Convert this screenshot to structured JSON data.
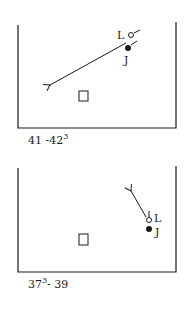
{
  "panels": [
    {
      "caption": "41 -42",
      "caption_sup": "3",
      "markers": {
        "open_label": "L",
        "filled_label": "J"
      },
      "arrow_direction": "down-left"
    },
    {
      "caption_pre": "37",
      "caption_sup": "3",
      "caption_post": "- 39",
      "markers": {
        "open_label": "L",
        "filled_label": "J"
      },
      "arrow_direction": "up-left"
    }
  ],
  "colors": {
    "ink": "#1a1a1a",
    "background": "#ffffff"
  }
}
